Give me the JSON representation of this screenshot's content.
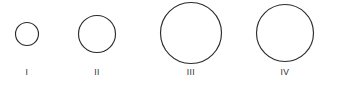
{
  "figure": {
    "background_color": "#ffffff",
    "stroke_color": "#2b2b2b",
    "label_color": "#2b2b2b",
    "stroke_width": 1.15,
    "width": 340,
    "height": 87
  },
  "chart_data": {
    "type": "scatter",
    "title": "",
    "xlabel": "",
    "ylabel": "",
    "categories": [
      "I",
      "II",
      "III",
      "IV"
    ],
    "values": [
      23,
      37,
      61,
      57
    ],
    "value_units": "pixel diameter",
    "grid": false,
    "legend": "none",
    "items": [
      {
        "label": "I",
        "cx": 27,
        "cy": 34,
        "diameter": 23,
        "radius": 11.5,
        "label_x": 27,
        "label_y": 75
      },
      {
        "label": "II",
        "cx": 97,
        "cy": 34,
        "diameter": 37,
        "radius": 18.5,
        "label_x": 97,
        "label_y": 75
      },
      {
        "label": "III",
        "cx": 191,
        "cy": 33,
        "diameter": 61,
        "radius": 30.5,
        "label_x": 191,
        "label_y": 75
      },
      {
        "label": "IV",
        "cx": 285,
        "cy": 33,
        "diameter": 57,
        "radius": 28.5,
        "label_x": 285,
        "label_y": 75
      }
    ]
  }
}
